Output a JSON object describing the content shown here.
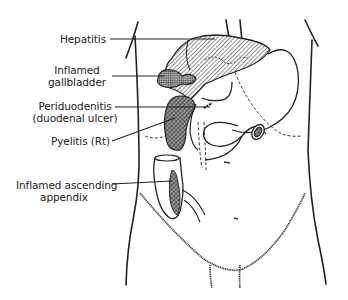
{
  "diagram": {
    "type": "anatomical-illustration",
    "colors": {
      "ink": "#222222",
      "background": "#ffffff"
    },
    "labels": [
      {
        "id": "hepatitis",
        "lines": [
          "Hepatitis"
        ]
      },
      {
        "id": "inflamed-gallbladder",
        "lines": [
          "Inflamed",
          "gallbladder"
        ]
      },
      {
        "id": "periduodenitis",
        "lines": [
          "Periduodenitis",
          "(duodenal ulcer)"
        ]
      },
      {
        "id": "pyelitis",
        "lines": [
          "Pyelitis (Rt)"
        ]
      },
      {
        "id": "inflamed-appendix",
        "lines": [
          "Inflamed ascending",
          "appendix"
        ]
      }
    ]
  }
}
